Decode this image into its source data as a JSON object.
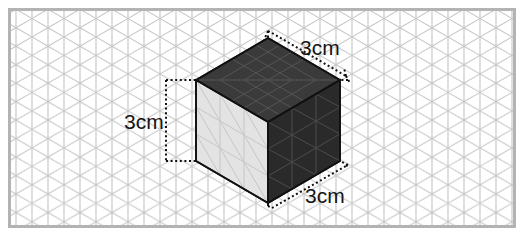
{
  "figure": {
    "shape_name": "cube",
    "projection": "isometric",
    "units": "cm",
    "edge_length": 3,
    "grid": {
      "type": "isometric-triangular",
      "cell_size_px": 16,
      "line_color": "#bfbfbf",
      "background_color": "#ffffff",
      "border_color": "#b0b0b0"
    },
    "faces": {
      "top": {
        "name": "top-face",
        "fill": "#3a3a3a",
        "grid_lines": true,
        "rows": 3,
        "cols": 3
      },
      "left": {
        "name": "left-face",
        "fill": "#e3e3e3",
        "grid_lines": true,
        "rows": 3,
        "cols": 3
      },
      "right": {
        "name": "right-face",
        "fill": "#2a2a2a",
        "grid_lines": true,
        "rows": 3,
        "cols": 3
      }
    },
    "edge_color": "#111111",
    "dimension_color": "#111111"
  },
  "labels": {
    "top_right": "3cm",
    "left": "3cm",
    "bottom_right": "3cm"
  }
}
